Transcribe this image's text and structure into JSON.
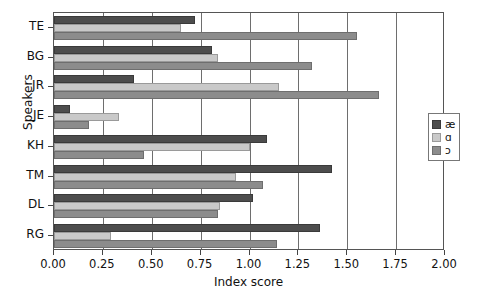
{
  "chart_data": {
    "type": "bar",
    "orientation": "horizontal",
    "title": "",
    "xlabel": "Index score",
    "ylabel": "Speakers",
    "xlim": [
      0.0,
      2.0
    ],
    "xticks": [
      "0.00",
      "0.25",
      "0.50",
      "0.75",
      "1.00",
      "1.25",
      "1.50",
      "1.75",
      "2.00"
    ],
    "xtick_values": [
      0.0,
      0.25,
      0.5,
      0.75,
      1.0,
      1.25,
      1.5,
      1.75,
      2.0
    ],
    "grid": "vertical",
    "legend_position": "right",
    "categories": [
      "TE",
      "BG",
      "JR",
      "JE",
      "KH",
      "TM",
      "DL",
      "RG"
    ],
    "series": [
      {
        "name": "æ",
        "color": "#4d4d4d",
        "values": [
          0.72,
          0.81,
          0.41,
          0.08,
          1.09,
          1.42,
          1.02,
          1.36
        ]
      },
      {
        "name": "ɑ",
        "color": "#c9c9c9",
        "values": [
          0.65,
          0.84,
          1.15,
          0.33,
          1.0,
          0.93,
          0.85,
          0.29
        ]
      },
      {
        "name": "ɔ",
        "color": "#8c8c8c",
        "values": [
          1.55,
          1.32,
          1.66,
          0.18,
          0.46,
          1.07,
          0.84,
          1.14
        ]
      }
    ]
  },
  "legend": {
    "items": [
      {
        "label": "æ"
      },
      {
        "label": "ɑ"
      },
      {
        "label": "ɔ"
      }
    ]
  }
}
